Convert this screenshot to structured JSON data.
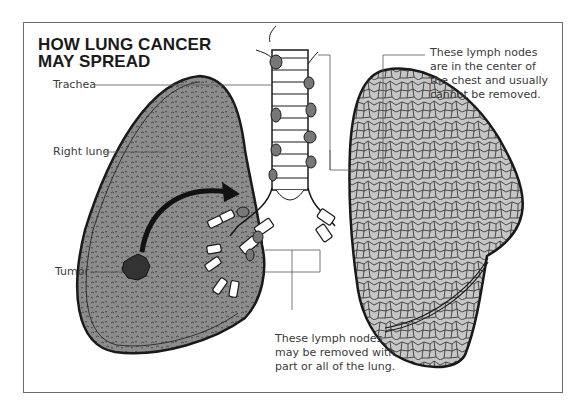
{
  "title": {
    "line1": "HOW LUNG CANCER",
    "line2": "MAY SPREAD"
  },
  "labels": {
    "trachea": "Trachea",
    "right_lung": "Right lung",
    "tumor": "Tumor"
  },
  "notes": {
    "central_nodes": {
      "lines": [
        "These lymph nodes",
        "are in the center of",
        "the chest and usually",
        "cannot be removed."
      ]
    },
    "removable_nodes": {
      "lines": [
        "These lymph nodes",
        "may be removed with",
        "part or all of the lung."
      ]
    }
  },
  "colors": {
    "right_lung_fill": "#8a8a8a",
    "left_lung_fill": "#c4c4c4",
    "lymph_node": "#777777",
    "tumor": "#333333",
    "outline": "#1a1a1a",
    "frame": "#6b6b6b"
  }
}
